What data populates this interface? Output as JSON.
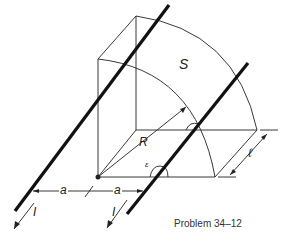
{
  "figure": {
    "caption": "Problem 34–12",
    "labels": {
      "surface": "S",
      "radius": "R",
      "angle": "ε",
      "length": "ℓ",
      "distance_left": "a",
      "distance_right": "a",
      "current_left": "I",
      "current_right": "I"
    },
    "colors": {
      "ink": "#111111",
      "background": "#ffffff"
    }
  }
}
